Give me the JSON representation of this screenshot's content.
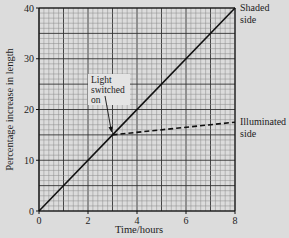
{
  "chart_data": {
    "type": "line",
    "title": "",
    "xlabel": "Time/hours",
    "ylabel": "Percentage increase in length",
    "xlim": [
      0,
      8
    ],
    "ylim": [
      0,
      40
    ],
    "x_ticks": [
      0,
      2,
      4,
      6,
      8
    ],
    "y_ticks": [
      0,
      10,
      20,
      30,
      40
    ],
    "grid": true,
    "grid_minor_x_step": 0.2,
    "grid_minor_y_step": 1,
    "series": [
      {
        "name": "Shaded side",
        "label_lines": [
          "Shaded",
          "side"
        ],
        "style": "solid",
        "x": [
          0,
          3,
          8
        ],
        "y": [
          0,
          15,
          40
        ]
      },
      {
        "name": "Illuminated side",
        "label_lines": [
          "Illuminated",
          "side"
        ],
        "style": "dashed",
        "x": [
          3,
          8
        ],
        "y": [
          15,
          17.5
        ]
      }
    ],
    "annotations": [
      {
        "text_lines": [
          "Light",
          "switched",
          "on"
        ],
        "arrow_to": {
          "x": 3,
          "y": 15
        }
      }
    ]
  },
  "colors": {
    "background": "#dcdcdc",
    "grid_minor": "#8a8a8a",
    "grid_major": "#333333",
    "line": "#111111",
    "annotation_box": "#e4e4e4"
  }
}
